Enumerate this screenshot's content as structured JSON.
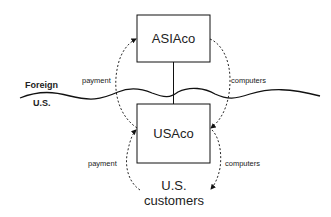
{
  "diagram": {
    "entities": {
      "foreign_company": "ASIAco",
      "us_company": "USAco",
      "customers_line1": "U.S.",
      "customers_line2": "customers"
    },
    "regions": {
      "top": "Foreign",
      "bottom": "U.S."
    },
    "flows": {
      "upper_left": "payment",
      "upper_right": "computers",
      "lower_left": "payment",
      "lower_right": "computers"
    },
    "colors": {
      "line": "#111111",
      "text": "#222222",
      "background": "#ffffff"
    }
  }
}
